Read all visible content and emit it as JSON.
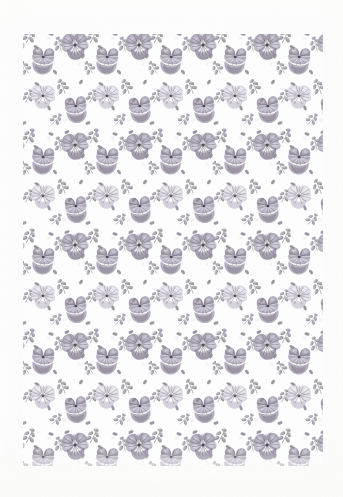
{
  "artwork": {
    "title": "Pansy floral repeat pattern swatch",
    "subject": "pansy-viola-flowers",
    "medium": "printed-textile-scan",
    "orientation": "portrait",
    "canvas": {
      "width": 343,
      "height": 497
    },
    "printed_area": {
      "left": 23,
      "top": 34,
      "width": 300,
      "height": 432
    },
    "margins": {
      "top": 34,
      "right": 20,
      "bottom": 31,
      "left": 23
    }
  },
  "palette": {
    "paper": "#fdfdfc",
    "background": "#fefefe",
    "flower_dark": "#7b7487",
    "flower_mid": "#9b94a6",
    "flower_light": "#c4bfcd",
    "flower_pale": "#ded9e4",
    "petal_wash": "#b3adbe",
    "leaf_dark": "#7f7b88",
    "leaf_mid": "#a09caa",
    "leaf_light": "#c7c4ce",
    "stamen_dark": "#4b4654",
    "dot_tint": "#f2f0f4",
    "vignette": "#eeeeec"
  },
  "pattern": {
    "type": "repeating-grid-half-drop",
    "tile_width": 64,
    "tile_height": 50,
    "row_offset_x": 32,
    "columns": 6,
    "rows": 10,
    "motifs": [
      {
        "name": "pansy-flower-front",
        "count_per_tile": 1,
        "scale": 1.0
      },
      {
        "name": "pansy-flower-side",
        "count_per_tile": 1,
        "scale": 0.9
      },
      {
        "name": "leaf-sprig",
        "count_per_tile": 2,
        "scale": 0.8
      },
      {
        "name": "small-bud",
        "count_per_tile": 2,
        "scale": 0.55
      },
      {
        "name": "background-dot",
        "count_per_tile": 1,
        "scale": 0.3
      }
    ]
  },
  "labels": {
    "swatch_name": "Pansy Repeat",
    "flower_label": "pansy",
    "leaf_label": "leaf sprig",
    "dot_label": "ground dot"
  }
}
